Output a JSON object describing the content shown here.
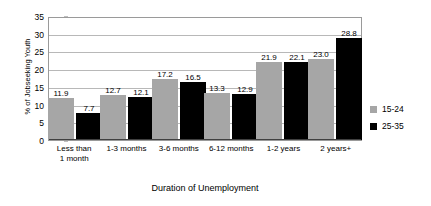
{
  "chart_data": {
    "type": "bar",
    "title": "",
    "xlabel": "Duration of Unemployment",
    "ylabel": "% of Jobseeking Youth",
    "categories": [
      "Less than\n1 month",
      "1-3 months",
      "3-6 months",
      "6-12 months",
      "1-2 years",
      "2 years+"
    ],
    "category_lines": [
      [
        "Less than",
        "1 month"
      ],
      [
        "1-3 months"
      ],
      [
        "3-6 months"
      ],
      [
        "6-12 months"
      ],
      [
        "1-2 years"
      ],
      [
        "2 years+"
      ]
    ],
    "series": [
      {
        "name": "15-24",
        "color": "#a6a6a6",
        "values": [
          11.9,
          12.7,
          17.2,
          13.3,
          21.9,
          23.0
        ],
        "labels": [
          "11.9",
          "12.7",
          "17.2",
          "13.3",
          "21.9",
          "23.0"
        ]
      },
      {
        "name": "25-35",
        "color": "#000000",
        "values": [
          7.7,
          12.1,
          16.5,
          12.9,
          22.1,
          28.8
        ],
        "labels": [
          "7.7",
          "12.1",
          "16.5",
          "12.9",
          "22.1",
          "28.8"
        ]
      }
    ],
    "ylim": [
      0,
      35
    ],
    "yticks": [
      0,
      5,
      10,
      15,
      20,
      25,
      30,
      35
    ],
    "ytick_labels": [
      "0",
      "5",
      "10",
      "15",
      "20",
      "25",
      "30",
      "35"
    ],
    "grid": "horizontal",
    "legend_position": "right"
  },
  "legend": {
    "entries": [
      {
        "label": "15-24",
        "color": "#a6a6a6"
      },
      {
        "label": "25-35",
        "color": "#000000"
      }
    ]
  }
}
